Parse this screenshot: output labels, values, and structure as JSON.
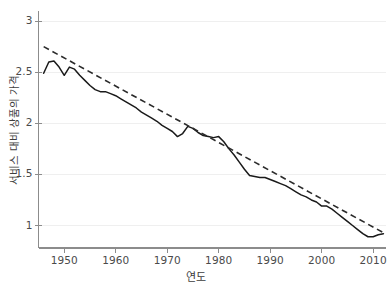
{
  "chart_data": {
    "type": "line",
    "title": "",
    "xlabel": "연도",
    "ylabel": "서비스 대비 상품의 가격",
    "xlim": [
      1945.0,
      2012.5
    ],
    "ylim": [
      0.78,
      3.05
    ],
    "xticks": [
      1950,
      1960,
      1970,
      1980,
      1990,
      2000,
      2010
    ],
    "xtick_labels": [
      "1950",
      "1960",
      "1970",
      "1980",
      "1990",
      "2000",
      "2010"
    ],
    "yticks": [
      1,
      1.5,
      2,
      2.5,
      3
    ],
    "ytick_labels": [
      "1",
      "1.5",
      "2",
      "2.5",
      "3"
    ],
    "grid": "horizontal",
    "legend": "none",
    "series": [
      {
        "name": "서비스 대비 상품의 가격",
        "style": "solid",
        "color": "#1a1a1a",
        "x": [
          1946,
          1947,
          1948,
          1949,
          1950,
          1951,
          1952,
          1953,
          1954,
          1955,
          1956,
          1957,
          1958,
          1959,
          1960,
          1961,
          1962,
          1963,
          1964,
          1965,
          1966,
          1967,
          1968,
          1969,
          1970,
          1971,
          1972,
          1973,
          1974,
          1975,
          1976,
          1977,
          1978,
          1979,
          1980,
          1981,
          1982,
          1983,
          1984,
          1985,
          1986,
          1987,
          1988,
          1989,
          1990,
          1991,
          1992,
          1993,
          1994,
          1995,
          1996,
          1997,
          1998,
          1999,
          2000,
          2001,
          2002,
          2003,
          2004,
          2005,
          2006,
          2007,
          2008,
          2009,
          2010,
          2011,
          2012
        ],
        "values": [
          2.49,
          2.6,
          2.61,
          2.55,
          2.47,
          2.55,
          2.53,
          2.47,
          2.42,
          2.37,
          2.33,
          2.31,
          2.31,
          2.29,
          2.27,
          2.24,
          2.21,
          2.18,
          2.15,
          2.11,
          2.08,
          2.05,
          2.02,
          1.98,
          1.95,
          1.92,
          1.87,
          1.9,
          1.97,
          1.95,
          1.91,
          1.88,
          1.87,
          1.86,
          1.87,
          1.82,
          1.75,
          1.69,
          1.62,
          1.55,
          1.49,
          1.48,
          1.47,
          1.47,
          1.45,
          1.43,
          1.41,
          1.39,
          1.36,
          1.33,
          1.3,
          1.28,
          1.25,
          1.23,
          1.19,
          1.19,
          1.16,
          1.12,
          1.08,
          1.04,
          1.0,
          0.96,
          0.92,
          0.89,
          0.89,
          0.91,
          0.92
        ]
      },
      {
        "name": "추세선",
        "style": "dashed",
        "color": "#2b2b2b",
        "x": [
          1946,
          2012
        ],
        "values": [
          2.75,
          0.93
        ]
      }
    ]
  },
  "axes": {
    "x_title": "연도",
    "y_title": "서비스 대비 상품의 가격",
    "x_tick_labels": [
      "1950",
      "1960",
      "1970",
      "1980",
      "1990",
      "2000",
      "2010"
    ],
    "y_tick_labels": [
      "1",
      "1.5",
      "2",
      "2.5",
      "3"
    ]
  },
  "colors": {
    "series_line": "#1a1a1a",
    "trend_line": "#2b2b2b",
    "gridline": "#efefef",
    "axis": "#8c8c8c",
    "text": "#3d3d3d",
    "background": "#ffffff"
  },
  "top_strip": {
    "clipped_text": ""
  }
}
